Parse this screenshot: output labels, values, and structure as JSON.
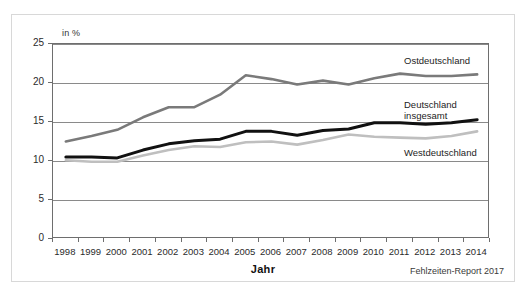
{
  "chart_data": {
    "type": "line",
    "title": "",
    "xlabel": "Jahr",
    "ylabel": "",
    "unit_label": "in %",
    "x": [
      1998,
      1999,
      2000,
      2001,
      2002,
      2003,
      2004,
      2005,
      2006,
      2007,
      2008,
      2009,
      2010,
      2011,
      2012,
      2013,
      2014
    ],
    "xtick_labels": [
      "1998",
      "1999",
      "2000",
      "2001",
      "2002",
      "2003",
      "2004",
      "2005",
      "2006",
      "2007",
      "2008",
      "2009",
      "2010",
      "2011",
      "2012",
      "2013",
      "2014"
    ],
    "ytick_labels": [
      "0",
      "5",
      "10",
      "15",
      "20",
      "25"
    ],
    "yticks": [
      0,
      5,
      10,
      15,
      20,
      25
    ],
    "ylim": [
      0,
      25
    ],
    "grid": true,
    "legend_position": "inline-right",
    "series": [
      {
        "name": "Ostdeutschland",
        "color": "#7a7a7a",
        "values": [
          12.5,
          13.2,
          14.0,
          15.6,
          16.9,
          16.9,
          18.5,
          21.0,
          20.5,
          19.8,
          20.3,
          19.8,
          20.6,
          21.2,
          20.9,
          20.9,
          21.1
        ]
      },
      {
        "name": "Deutschland insgesamt",
        "color": "#111111",
        "values": [
          10.5,
          10.5,
          10.4,
          11.4,
          12.2,
          12.6,
          12.8,
          13.8,
          13.8,
          13.3,
          13.9,
          14.1,
          14.9,
          14.9,
          14.7,
          14.9,
          15.3
        ]
      },
      {
        "name": "Westdeutschland",
        "color": "#bfbfbf",
        "values": [
          10.1,
          9.9,
          9.9,
          10.7,
          11.4,
          11.9,
          11.8,
          12.4,
          12.5,
          12.1,
          12.7,
          13.4,
          13.1,
          13.0,
          12.9,
          13.2,
          13.8
        ]
      }
    ],
    "source_note": "Fehlzeiten-Report 2017"
  },
  "labels": {
    "ost": "Ostdeutschland",
    "gesamt_line1": "Deutschland",
    "gesamt_line2": "insgesamt",
    "west": "Westdeutschland"
  }
}
